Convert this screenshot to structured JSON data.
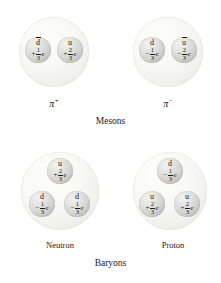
{
  "figure": {
    "title_groups": {
      "mesons": "Mesons",
      "baryons": "Baryons"
    },
    "particles": [
      {
        "id": "pi-plus",
        "kind": "meson",
        "label_symbol": "π",
        "label_superscript": "+",
        "label_full": "π+",
        "quarks": [
          {
            "position": "left",
            "flavor": "d",
            "antiparticle": true,
            "flavor_display": "d̄",
            "charge_sign": "+",
            "charge_numerator": "1",
            "charge_denominator": "3",
            "charge_unit": "e",
            "charge_full": "+1/3 e"
          },
          {
            "position": "right",
            "flavor": "u",
            "antiparticle": false,
            "flavor_display": "u",
            "charge_sign": "+",
            "charge_numerator": "2",
            "charge_denominator": "3",
            "charge_unit": "e",
            "charge_full": "+2/3 e"
          }
        ]
      },
      {
        "id": "pi-minus",
        "kind": "meson",
        "label_symbol": "π",
        "label_superscript": "−",
        "label_full": "π−",
        "quarks": [
          {
            "position": "left",
            "flavor": "d",
            "antiparticle": false,
            "flavor_display": "d",
            "charge_sign": "−",
            "charge_numerator": "1",
            "charge_denominator": "3",
            "charge_unit": "e",
            "charge_full": "−1/3 e"
          },
          {
            "position": "right",
            "flavor": "u",
            "antiparticle": true,
            "flavor_display": "ū",
            "charge_sign": "−",
            "charge_numerator": "2",
            "charge_denominator": "3",
            "charge_unit": "e",
            "charge_full": "−2/3 e"
          }
        ]
      },
      {
        "id": "neutron",
        "kind": "baryon",
        "label_full": "Neutron",
        "quarks": [
          {
            "position": "top",
            "flavor": "u",
            "antiparticle": false,
            "flavor_display": "u",
            "charge_sign": "+",
            "charge_numerator": "2",
            "charge_denominator": "3",
            "charge_unit": "e",
            "charge_full": "+2/3 e"
          },
          {
            "position": "bottom-left",
            "flavor": "d",
            "antiparticle": false,
            "flavor_display": "d",
            "charge_sign": "−",
            "charge_numerator": "1",
            "charge_denominator": "3",
            "charge_unit": "e",
            "charge_full": "−1/3 e"
          },
          {
            "position": "bottom-right",
            "flavor": "d",
            "antiparticle": false,
            "flavor_display": "d",
            "charge_sign": "−",
            "charge_numerator": "1",
            "charge_denominator": "3",
            "charge_unit": "e",
            "charge_full": "−1/3 e"
          }
        ]
      },
      {
        "id": "proton",
        "kind": "baryon",
        "label_full": "Proton",
        "quarks": [
          {
            "position": "top",
            "flavor": "d",
            "antiparticle": false,
            "flavor_display": "d",
            "charge_sign": "−",
            "charge_numerator": "1",
            "charge_denominator": "3",
            "charge_unit": "e",
            "charge_full": "−1/3 e"
          },
          {
            "position": "bottom-left",
            "flavor": "u",
            "antiparticle": false,
            "flavor_display": "u",
            "charge_sign": "+",
            "charge_numerator": "2",
            "charge_denominator": "3",
            "charge_unit": "e",
            "charge_full": "+2/3 e"
          },
          {
            "position": "bottom-right",
            "flavor": "u",
            "antiparticle": false,
            "flavor_display": "u",
            "charge_sign": "+",
            "charge_numerator": "2",
            "charge_denominator": "3",
            "charge_unit": "e",
            "charge_full": "+2/3 e"
          }
        ]
      }
    ],
    "colors": {
      "background": "#ffffff",
      "hadron_sphere": "#f4f4f1",
      "quark_sphere": "#d6d6d2",
      "text": "#17171a"
    }
  }
}
